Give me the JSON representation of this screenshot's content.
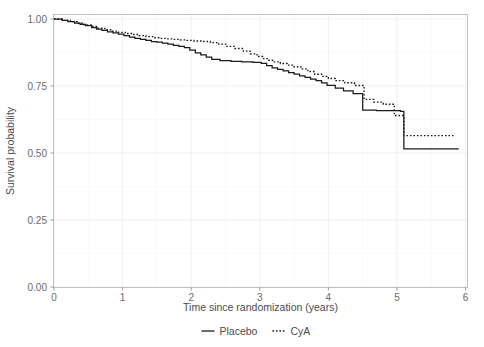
{
  "chart_data": {
    "type": "line",
    "subtype": "kaplan-meier-step",
    "title": "",
    "xlabel": "Time since randomization (years)",
    "ylabel": "Survival probability",
    "xlim": [
      0,
      6
    ],
    "ylim": [
      0,
      1
    ],
    "xticks": [
      0,
      1,
      2,
      3,
      4,
      5,
      6
    ],
    "xtick_labels": [
      "0",
      "1",
      "2",
      "3",
      "4",
      "5",
      "6"
    ],
    "yticks": [
      0.0,
      0.25,
      0.5,
      0.75,
      1.0
    ],
    "ytick_labels": [
      "0.00",
      "0.25",
      "0.50",
      "0.75",
      "1.00"
    ],
    "grid": true,
    "grid_minor": true,
    "legend_position": "bottom",
    "legend": [
      "Placebo",
      "CyA"
    ],
    "series": [
      {
        "name": "Placebo",
        "style": "solid",
        "color": "#1a1a1a",
        "points": [
          [
            0.0,
            1.0
          ],
          [
            0.12,
            0.995
          ],
          [
            0.2,
            0.99
          ],
          [
            0.3,
            0.985
          ],
          [
            0.38,
            0.98
          ],
          [
            0.46,
            0.975
          ],
          [
            0.55,
            0.968
          ],
          [
            0.62,
            0.962
          ],
          [
            0.7,
            0.958
          ],
          [
            0.78,
            0.952
          ],
          [
            0.86,
            0.948
          ],
          [
            0.94,
            0.944
          ],
          [
            1.02,
            0.938
          ],
          [
            1.1,
            0.932
          ],
          [
            1.18,
            0.928
          ],
          [
            1.26,
            0.924
          ],
          [
            1.34,
            0.92
          ],
          [
            1.42,
            0.916
          ],
          [
            1.5,
            0.914
          ],
          [
            1.58,
            0.91
          ],
          [
            1.66,
            0.906
          ],
          [
            1.74,
            0.902
          ],
          [
            1.82,
            0.898
          ],
          [
            1.9,
            0.893
          ],
          [
            1.98,
            0.884
          ],
          [
            2.06,
            0.874
          ],
          [
            2.14,
            0.866
          ],
          [
            2.22,
            0.858
          ],
          [
            2.3,
            0.849
          ],
          [
            2.42,
            0.845
          ],
          [
            2.58,
            0.842
          ],
          [
            2.74,
            0.84
          ],
          [
            2.9,
            0.838
          ],
          [
            3.02,
            0.834
          ],
          [
            3.1,
            0.826
          ],
          [
            3.18,
            0.818
          ],
          [
            3.26,
            0.812
          ],
          [
            3.34,
            0.806
          ],
          [
            3.42,
            0.8
          ],
          [
            3.5,
            0.794
          ],
          [
            3.58,
            0.788
          ],
          [
            3.66,
            0.782
          ],
          [
            3.74,
            0.776
          ],
          [
            3.82,
            0.77
          ],
          [
            3.9,
            0.762
          ],
          [
            3.98,
            0.752
          ],
          [
            4.1,
            0.742
          ],
          [
            4.22,
            0.732
          ],
          [
            4.36,
            0.722
          ],
          [
            4.5,
            0.66
          ],
          [
            4.7,
            0.658
          ],
          [
            5.05,
            0.655
          ],
          [
            5.1,
            0.515
          ],
          [
            5.9,
            0.515
          ]
        ]
      },
      {
        "name": "CyA",
        "style": "dotted",
        "color": "#1a1a1a",
        "points": [
          [
            0.0,
            1.0
          ],
          [
            0.14,
            0.995
          ],
          [
            0.24,
            0.99
          ],
          [
            0.34,
            0.984
          ],
          [
            0.44,
            0.978
          ],
          [
            0.54,
            0.972
          ],
          [
            0.64,
            0.966
          ],
          [
            0.74,
            0.96
          ],
          [
            0.84,
            0.955
          ],
          [
            0.94,
            0.95
          ],
          [
            1.04,
            0.946
          ],
          [
            1.14,
            0.942
          ],
          [
            1.24,
            0.938
          ],
          [
            1.34,
            0.934
          ],
          [
            1.44,
            0.93
          ],
          [
            1.54,
            0.928
          ],
          [
            1.64,
            0.926
          ],
          [
            1.74,
            0.924
          ],
          [
            1.84,
            0.922
          ],
          [
            1.94,
            0.92
          ],
          [
            2.04,
            0.918
          ],
          [
            2.16,
            0.916
          ],
          [
            2.28,
            0.912
          ],
          [
            2.4,
            0.906
          ],
          [
            2.52,
            0.898
          ],
          [
            2.64,
            0.89
          ],
          [
            2.76,
            0.88
          ],
          [
            2.86,
            0.87
          ],
          [
            2.96,
            0.86
          ],
          [
            3.04,
            0.852
          ],
          [
            3.12,
            0.846
          ],
          [
            3.2,
            0.84
          ],
          [
            3.3,
            0.834
          ],
          [
            3.4,
            0.828
          ],
          [
            3.5,
            0.822
          ],
          [
            3.6,
            0.814
          ],
          [
            3.7,
            0.804
          ],
          [
            3.8,
            0.794
          ],
          [
            3.9,
            0.786
          ],
          [
            4.0,
            0.778
          ],
          [
            4.1,
            0.77
          ],
          [
            4.24,
            0.762
          ],
          [
            4.38,
            0.752
          ],
          [
            4.52,
            0.7
          ],
          [
            4.66,
            0.69
          ],
          [
            4.8,
            0.682
          ],
          [
            4.96,
            0.64
          ],
          [
            5.1,
            0.565
          ],
          [
            5.85,
            0.565
          ]
        ]
      }
    ]
  },
  "axes": {
    "x_title": "Time since randomization (years)",
    "y_title": "Survival probability",
    "x_ticks": [
      "0",
      "1",
      "2",
      "3",
      "4",
      "5",
      "6"
    ],
    "y_ticks": [
      "0.00",
      "0.25",
      "0.50",
      "0.75",
      "1.00"
    ]
  },
  "legend": {
    "items": [
      {
        "label": "Placebo",
        "key": "solid-line-key"
      },
      {
        "label": "CyA",
        "key": "dotted-line-key"
      }
    ]
  },
  "colors": {
    "curve": "#1a1a1a",
    "panel_border": "#b3b3b3",
    "grid_major": "#ebebeb",
    "grid_minor": "#f4f4f4",
    "text": "#4d4d4d",
    "tick_text": "#6b6b6b",
    "background": "#ffffff"
  }
}
